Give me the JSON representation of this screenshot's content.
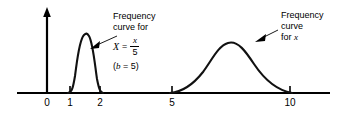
{
  "figure": {
    "type": "line",
    "axis": {
      "x_ticks": [
        {
          "label": "0",
          "px": 47
        },
        {
          "label": "1",
          "px": 70
        },
        {
          "label": "2",
          "px": 100
        },
        {
          "label": "5",
          "px": 172
        },
        {
          "label": "10",
          "px": 290
        }
      ],
      "x_axis_y_px": 93,
      "x_axis_start_px": 17,
      "x_axis_end_px": 330,
      "y_axis_x_px": 47,
      "y_axis_top_px": 10,
      "has_y_arrow": true,
      "grid": false
    },
    "annotations": {
      "left": {
        "line1": "Frequency",
        "line2": "curve for",
        "formula_lhs": "X",
        "formula_eq": "=",
        "formula_numerator": "x",
        "formula_denominator": "5",
        "note_open": "(",
        "note_var": "b",
        "note_rest": " = 5)"
      },
      "right": {
        "line1": "Frequency",
        "line2": "curve",
        "line3_prefix": "for ",
        "line3_var": "x"
      }
    },
    "curves": [
      {
        "name": "frequency-curve-for-X",
        "description": "narrow tall bell curve between x=1 and x=2, peak near 1.6",
        "peak_x_px": 85,
        "peak_y_px": 35,
        "left_foot_px": 69,
        "right_foot_px": 101
      },
      {
        "name": "frequency-curve-for-x",
        "description": "broad bell curve between x=5 and x=10, peak near 7.5",
        "peak_x_px": 230,
        "peak_y_px": 42,
        "left_foot_px": 171,
        "right_foot_px": 291
      }
    ],
    "colors": {
      "ink": "#000000",
      "background": "#ffffff"
    }
  }
}
